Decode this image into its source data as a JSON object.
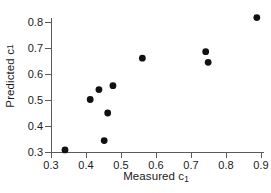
{
  "chart_data": {
    "type": "scatter",
    "title": "",
    "xlabel": "Measured c",
    "xlabel_subscript": "1",
    "ylabel": "Predicted c",
    "ylabel_subscript": "1",
    "xlim": [
      0.285,
      0.915
    ],
    "ylim": [
      0.293,
      0.835
    ],
    "xticks": [
      0.3,
      0.4,
      0.5,
      0.6,
      0.7,
      0.8,
      0.9
    ],
    "xtick_labels": [
      "0.3",
      "0.4",
      "0.5",
      "0.6",
      "0.7",
      "0.8",
      "0.9"
    ],
    "yticks": [
      0.3,
      0.4,
      0.5,
      0.6,
      0.7,
      0.8
    ],
    "ytick_labels": [
      "0.3",
      "0.4",
      "0.5",
      "0.6",
      "0.7",
      "0.8"
    ],
    "grid": false,
    "legend": false,
    "marker": "filled-circle",
    "marker_color": "#111111",
    "marker_size_px": 3.4,
    "axis_color": "#5a5a5a",
    "background": "#ffffff",
    "x": [
      0.34,
      0.412,
      0.437,
      0.452,
      0.462,
      0.477,
      0.561,
      0.742,
      0.749,
      0.888
    ],
    "y": [
      0.308,
      0.502,
      0.54,
      0.344,
      0.45,
      0.555,
      0.661,
      0.686,
      0.645,
      0.817
    ],
    "points": [
      {
        "x": 0.34,
        "y": 0.308
      },
      {
        "x": 0.412,
        "y": 0.502
      },
      {
        "x": 0.437,
        "y": 0.54
      },
      {
        "x": 0.452,
        "y": 0.344
      },
      {
        "x": 0.462,
        "y": 0.45
      },
      {
        "x": 0.477,
        "y": 0.555
      },
      {
        "x": 0.561,
        "y": 0.661
      },
      {
        "x": 0.742,
        "y": 0.686
      },
      {
        "x": 0.749,
        "y": 0.645
      },
      {
        "x": 0.888,
        "y": 0.817
      }
    ]
  }
}
